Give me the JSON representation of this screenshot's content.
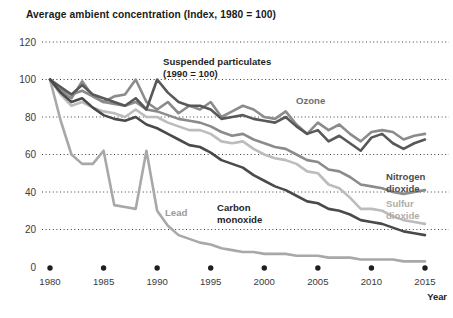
{
  "chart_data": {
    "type": "line",
    "title": "Average ambient concentration (Index, 1980 = 100)",
    "xlabel": "Year",
    "ylabel": "",
    "xlim": [
      1980,
      2015
    ],
    "ylim": [
      0,
      120
    ],
    "grid": true,
    "legend_position": "inline-annotations",
    "yticks": [
      0,
      20,
      40,
      60,
      80,
      100,
      120
    ],
    "ytick_labels": [
      "0",
      "20",
      "40",
      "60",
      "80",
      "100",
      "120"
    ],
    "xticks": [
      1980,
      1985,
      1990,
      1995,
      2000,
      2005,
      2010,
      2015
    ],
    "xtick_labels": [
      "1980",
      "1985",
      "1990",
      "1995",
      "2000",
      "2005",
      "2010",
      "2015"
    ],
    "x": [
      1980,
      1981,
      1982,
      1983,
      1984,
      1985,
      1986,
      1987,
      1988,
      1989,
      1990,
      1991,
      1992,
      1993,
      1994,
      1995,
      1996,
      1997,
      1998,
      1999,
      2000,
      2001,
      2002,
      2003,
      2004,
      2005,
      2006,
      2007,
      2008,
      2009,
      2010,
      2011,
      2012,
      2013,
      2014,
      2015
    ],
    "series": [
      {
        "name": "Ozone",
        "color": "#8b8b8b",
        "width": 2.6,
        "label": "Ozone",
        "label_x": 296,
        "label_y": 104,
        "label_color": "#6e6e6e",
        "values": [
          100,
          94,
          90,
          99,
          91,
          88,
          91,
          92,
          100,
          88,
          84,
          88,
          82,
          86,
          84,
          88,
          80,
          83,
          86,
          84,
          80,
          79,
          83,
          76,
          71,
          77,
          73,
          76,
          71,
          67,
          72,
          73,
          72,
          68,
          70,
          71
        ]
      },
      {
        "name": "Suspended particulates (1990 = 100)",
        "color": "#585858",
        "width": 2.6,
        "label": "Suspended particulates",
        "label2": "(1990 = 100)",
        "label_x": 163,
        "label_y": 65,
        "label_color": "#1f1f1f",
        "values": [
          100,
          96,
          92,
          97,
          92,
          90,
          88,
          86,
          90,
          84,
          100,
          93,
          88,
          86,
          86,
          84,
          79,
          80,
          81,
          79,
          78,
          77,
          80,
          75,
          71,
          73,
          67,
          70,
          66,
          62,
          69,
          71,
          66,
          63,
          66,
          68
        ]
      },
      {
        "name": "Nitrogen dioxide",
        "color": "#8b8b8b",
        "width": 2.6,
        "label": "Nitrogen",
        "label2": "dioxide",
        "label_x": 386,
        "label_y": 180,
        "label_color": "#4d4d4d",
        "values": [
          100,
          95,
          92,
          94,
          91,
          88,
          87,
          86,
          88,
          84,
          83,
          81,
          79,
          78,
          77,
          75,
          72,
          70,
          71,
          68,
          66,
          64,
          63,
          60,
          57,
          56,
          52,
          51,
          48,
          44,
          43,
          42,
          40,
          39,
          40,
          41
        ]
      },
      {
        "name": "Sulfur dioxide",
        "color": "#bcbcbc",
        "width": 2.6,
        "label": "Sulfur",
        "label2": "dioxide",
        "label_x": 386,
        "label_y": 207,
        "label_color": "#adadad",
        "values": [
          100,
          92,
          86,
          88,
          85,
          83,
          82,
          80,
          84,
          80,
          80,
          77,
          75,
          73,
          73,
          71,
          67,
          66,
          67,
          63,
          60,
          58,
          57,
          55,
          51,
          50,
          44,
          42,
          37,
          31,
          31,
          30,
          27,
          25,
          24,
          23
        ]
      },
      {
        "name": "Carbon monoxide",
        "color": "#4a4a4a",
        "width": 2.6,
        "label": "Carbon",
        "label2": "monoxide",
        "label_x": 217,
        "label_y": 211,
        "label_color": "#1f1f1f",
        "values": [
          100,
          93,
          88,
          90,
          85,
          81,
          79,
          78,
          80,
          76,
          74,
          71,
          68,
          65,
          64,
          61,
          57,
          55,
          53,
          49,
          46,
          43,
          41,
          38,
          35,
          34,
          31,
          30,
          28,
          25,
          24,
          23,
          21,
          19,
          18,
          17
        ]
      },
      {
        "name": "Lead",
        "color": "#a8a8a8",
        "width": 2.6,
        "label": "Lead",
        "label_x": 165,
        "label_y": 216,
        "label_color": "#9a9a9a",
        "values": [
          100,
          78,
          60,
          55,
          55,
          62,
          33,
          32,
          31,
          62,
          30,
          22,
          17,
          15,
          13,
          12,
          10,
          9,
          8,
          8,
          7,
          7,
          7,
          6,
          6,
          6,
          5,
          5,
          5,
          4,
          4,
          4,
          4,
          3,
          3,
          3
        ]
      }
    ]
  }
}
